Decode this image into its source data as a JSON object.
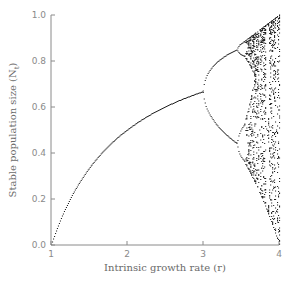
{
  "chart_data": {
    "type": "scatter",
    "title": "",
    "xlabel": "Intrinsic growth rate (r)",
    "ylabel": "Stable population size (N",
    "ylabel_subscript": "t",
    "xlim": [
      1,
      4
    ],
    "ylim": [
      0.0,
      1.0
    ],
    "xticks": [
      1,
      2,
      3,
      4
    ],
    "xtick_labels": [
      "1",
      "2",
      "3",
      "4"
    ],
    "yticks": [
      0.0,
      0.2,
      0.4,
      0.6,
      0.8,
      1.0
    ],
    "ytick_labels": [
      "0.0",
      "0.2",
      "0.4",
      "0.6",
      "0.8",
      "1.0"
    ],
    "grid": false,
    "legend": null,
    "model": "logistic map N(t+1) = r N(t) (1 - N(t))",
    "series": [
      {
        "name": "stable fixed point (r from 1 to 3)",
        "x": [
          1.0,
          1.25,
          1.5,
          1.75,
          2.0,
          2.25,
          2.5,
          2.75,
          3.0
        ],
        "values": [
          0.0,
          0.2,
          0.333,
          0.429,
          0.5,
          0.556,
          0.6,
          0.636,
          0.667
        ]
      },
      {
        "name": "period-2 branches (r from 3 to 3.45)",
        "x": [
          3.0,
          3.1,
          3.2,
          3.3,
          3.4,
          3.45
        ],
        "upper": [
          0.667,
          0.765,
          0.799,
          0.824,
          0.842,
          0.849
        ],
        "lower": [
          0.667,
          0.558,
          0.513,
          0.479,
          0.452,
          0.44
        ]
      },
      {
        "name": "chaotic region (r from ~3.57 to 4)",
        "x_range": [
          3.57,
          4.0
        ],
        "y_range_at_r4": [
          0.0,
          1.0
        ]
      }
    ],
    "render": {
      "r_steps": 230,
      "transient": 300,
      "samples_per_r": 40,
      "dot_color": "#222222",
      "axis_color": "#8a8a8a"
    }
  }
}
